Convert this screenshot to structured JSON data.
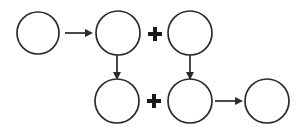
{
  "diagram": {
    "background_color": "#ffffff",
    "stroke_color": "#2b2b2b",
    "operator_color": "#1a1a1a",
    "width": 298,
    "height": 130,
    "nodes": [
      {
        "id": "node-1",
        "label": "",
        "cx": 38,
        "cy": 33,
        "r": 21
      },
      {
        "id": "node-2",
        "label": "",
        "cx": 118,
        "cy": 33,
        "r": 22
      },
      {
        "id": "node-3",
        "label": "",
        "cx": 190,
        "cy": 33,
        "r": 22
      },
      {
        "id": "node-4",
        "label": "",
        "cx": 117,
        "cy": 101,
        "r": 22
      },
      {
        "id": "node-5",
        "label": "",
        "cx": 190,
        "cy": 101,
        "r": 22
      },
      {
        "id": "node-6",
        "label": "",
        "cx": 267,
        "cy": 101,
        "r": 22
      }
    ],
    "arrows": [
      {
        "id": "arrow-1",
        "from": "node-1",
        "to": "node-2",
        "direction": "right",
        "x1": 65,
        "y1": 33,
        "x2": 93,
        "y2": 33
      },
      {
        "id": "arrow-2",
        "from": "node-2",
        "to": "node-4",
        "direction": "down",
        "x1": 117,
        "y1": 55,
        "x2": 117,
        "y2": 80
      },
      {
        "id": "arrow-3",
        "from": "node-3",
        "to": "node-5",
        "direction": "down",
        "x1": 190,
        "y1": 55,
        "x2": 190,
        "y2": 80
      },
      {
        "id": "arrow-4",
        "from": "node-5",
        "to": "node-6",
        "direction": "right",
        "x1": 215,
        "y1": 101,
        "x2": 243,
        "y2": 101
      }
    ],
    "operators": [
      {
        "id": "operator-1",
        "symbol": "+",
        "cx": 155,
        "cy": 34,
        "size": 14,
        "thickness": 4
      },
      {
        "id": "operator-2",
        "symbol": "+",
        "cx": 154,
        "cy": 101,
        "size": 14,
        "thickness": 4
      }
    ]
  }
}
